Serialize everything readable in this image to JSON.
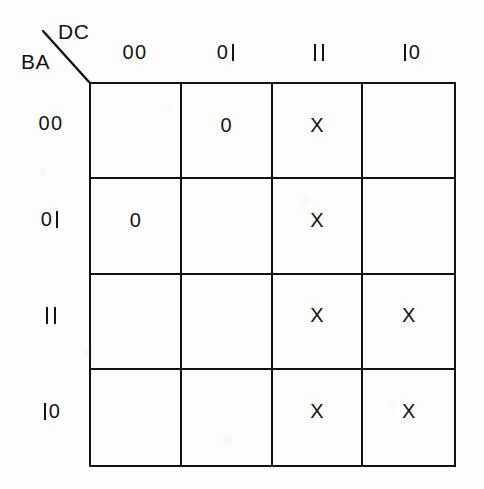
{
  "axes": {
    "column_label": "DC",
    "row_label": "BA"
  },
  "columns": [
    {
      "label": "00"
    },
    {
      "label": "01"
    },
    {
      "label": "11"
    },
    {
      "label": "10"
    }
  ],
  "rows": [
    {
      "label": "00"
    },
    {
      "label": "01"
    },
    {
      "label": "11"
    },
    {
      "label": "10"
    }
  ],
  "cells": [
    [
      "",
      "0",
      "X",
      ""
    ],
    [
      "0",
      "",
      "X",
      ""
    ],
    [
      "",
      "",
      "X",
      "X"
    ],
    [
      "",
      "",
      "X",
      "X"
    ]
  ],
  "colors": {
    "ink": "#141414",
    "line": "#121212",
    "paper": "#fdfdfd"
  }
}
